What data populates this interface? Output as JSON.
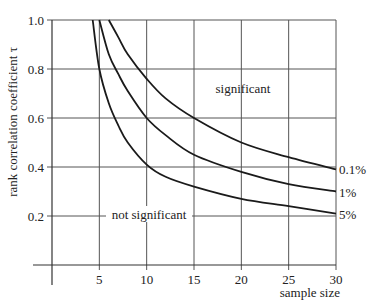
{
  "chart_data": {
    "type": "line",
    "title": "",
    "xlabel": "sample size",
    "ylabel": "rank correlation coefficient τ",
    "xlim": [
      0,
      30
    ],
    "ylim": [
      0,
      1.0
    ],
    "grid": true,
    "x_ticks": [
      5,
      10,
      15,
      20,
      25,
      30
    ],
    "x_tick_labels": [
      "5",
      "10",
      "15",
      "20",
      "25",
      "30"
    ],
    "y_ticks": [
      0.2,
      0.4,
      0.6,
      0.8,
      1.0
    ],
    "y_tick_labels": [
      "0.2",
      "0.4",
      "0.6",
      "0.8",
      "1.0"
    ],
    "legend_position": "right-end-of-lines",
    "series": [
      {
        "name": "0.1%",
        "x": [
          6.0,
          7,
          8,
          10,
          12,
          15,
          20,
          25,
          30
        ],
        "values": [
          1.0,
          0.93,
          0.86,
          0.76,
          0.68,
          0.6,
          0.5,
          0.44,
          0.39
        ]
      },
      {
        "name": "1%",
        "x": [
          5.0,
          6,
          7,
          8,
          10,
          12,
          15,
          20,
          25,
          30
        ],
        "values": [
          1.0,
          0.86,
          0.78,
          0.71,
          0.6,
          0.53,
          0.45,
          0.38,
          0.33,
          0.3
        ]
      },
      {
        "name": "5%",
        "x": [
          4.3,
          5,
          6,
          7,
          8,
          10,
          12,
          15,
          20,
          25,
          30
        ],
        "values": [
          1.0,
          0.8,
          0.66,
          0.57,
          0.5,
          0.41,
          0.36,
          0.32,
          0.27,
          0.24,
          0.21
        ]
      }
    ],
    "annotations": [
      {
        "text": "significant",
        "x": 20,
        "y": 0.7
      },
      {
        "text": "not significant",
        "x": 10,
        "y": 0.2
      }
    ]
  },
  "labels": {
    "significant": "significant",
    "not_significant": "not significant",
    "xlabel": "sample size",
    "ylabel": "rank correlation coefficient τ",
    "series_01": "0.1%",
    "series_1": "1%",
    "series_5": "5%"
  }
}
